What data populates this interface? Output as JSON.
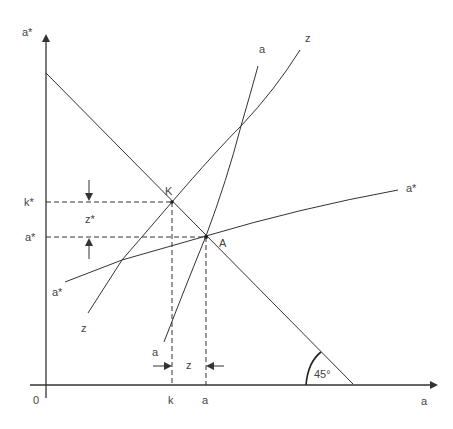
{
  "diagram": {
    "axes": {
      "y_label": "a*",
      "x_label": "a",
      "origin_label": "0"
    },
    "curves": {
      "a_label": "a",
      "z_label_top": "z",
      "z_label_bottom": "z",
      "a_star_label_right": "a*",
      "a_star_label_left": "a*"
    },
    "points": {
      "K": "K",
      "A": "A"
    },
    "y_ticks": {
      "k_star": "k*",
      "a_star": "a*",
      "gap": "z*"
    },
    "x_ticks": {
      "k": "k",
      "a": "a",
      "gap": "z",
      "a_small": "a"
    },
    "angle_label": "45°",
    "colors": {
      "line": "#333333",
      "text": "#444444",
      "background": "#ffffff"
    }
  }
}
